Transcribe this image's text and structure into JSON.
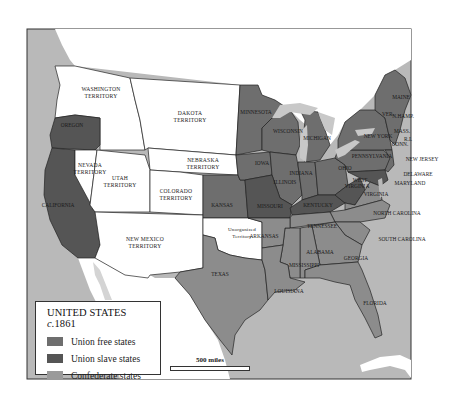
{
  "legend": {
    "title": "UNITED STATES",
    "title_circa": "c.",
    "title_year": "1861",
    "items": [
      {
        "label": "Union free states",
        "color": "#6e6e6e"
      },
      {
        "label": "Union slave states",
        "color": "#555555"
      },
      {
        "label": "Confederate states",
        "color": "#9a9a9a"
      }
    ]
  },
  "scale": {
    "label": "500 miles"
  },
  "colors": {
    "ocean": "#b9b9b9",
    "territory": "#ffffff",
    "free": "#6e6e6e",
    "slave": "#555555",
    "confederate": "#8c8c8c",
    "lakes": "#c8c8c8",
    "border": "#222222"
  },
  "labels": {
    "washington": [
      "WASHINGTON",
      "TERRITORY"
    ],
    "dakota": [
      "DAKOTA",
      "TERRITORY"
    ],
    "nebraska": [
      "NEBRASKA",
      "TERRITORY"
    ],
    "nevada": [
      "NEVADA",
      "TERRITORY"
    ],
    "utah": [
      "UTAH",
      "TERRITORY"
    ],
    "colorado": [
      "COLORADO",
      "TERRITORY"
    ],
    "new_mexico": [
      "NEW MEXICO",
      "TERRITORY"
    ],
    "unorganized": [
      "Unorganized",
      "Territory"
    ],
    "oregon": "OREGON",
    "california": "CALIFORNIA",
    "minnesota": "MINNESOTA",
    "wisconsin": "WISCONSIN",
    "michigan": "MICHIGAN",
    "iowa": "IOWA",
    "illinois": "ILLINOIS",
    "indiana": "INDIANA",
    "ohio": "OHIO",
    "kansas": "KANSAS",
    "missouri": "MISSOURI",
    "kentucky": "KENTUCKY",
    "west_virginia": [
      "WEST",
      "VIRGINIA"
    ],
    "virginia": "VIRGINIA",
    "pennsylvania": "PENNSYLVANIA",
    "new_york": "NEW YORK",
    "vermont": "VER.",
    "new_hampshire": "N.HAMP.",
    "maine": "MAINE",
    "massachusetts": "MASS.",
    "rhode_island": "R.I.",
    "connecticut": "CONN.",
    "new_jersey": "NEW JERSEY",
    "delaware": "DELAWARE",
    "maryland": "MARYLAND",
    "north_carolina": "NORTH CAROLINA",
    "south_carolina": "SOUTH CAROLINA",
    "tennessee": "TENNESSEE",
    "arkansas": "ARKANSAS",
    "alabama": "ALABAMA",
    "mississippi": "MISSISSIPPI",
    "georgia": "GEORGIA",
    "louisiana": "LOUISIANA",
    "texas": "TEXAS",
    "florida": "FLORIDA"
  }
}
